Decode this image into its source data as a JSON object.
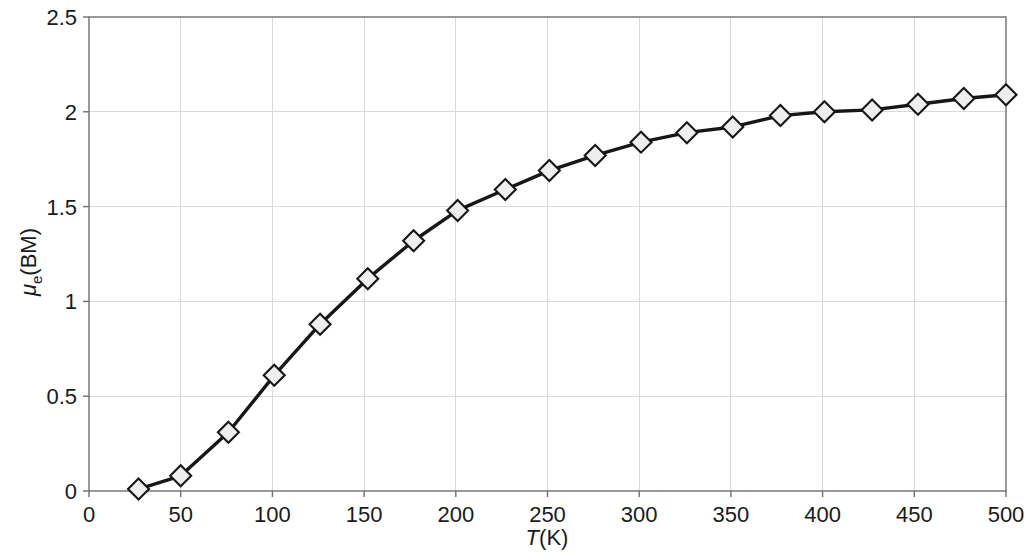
{
  "chart_data": {
    "type": "line",
    "title": "",
    "subtitle": "",
    "xlabel": "T(K)",
    "ylabel": "μe(BM)",
    "xlabel_parts": {
      "italic": "T",
      "rest": "(K)"
    },
    "ylabel_parts": {
      "symbol": "μ",
      "subscript": "e",
      "rest": "(BM)"
    },
    "xlim": [
      0,
      500
    ],
    "ylim": [
      0,
      2.5
    ],
    "xticks": [
      0,
      50,
      100,
      150,
      200,
      250,
      300,
      350,
      400,
      450,
      500
    ],
    "xticklabels": [
      "0",
      "50",
      "100",
      "150",
      "200",
      "250",
      "300",
      "350",
      "400",
      "450",
      "500"
    ],
    "yticks": [
      0,
      0.5,
      1,
      1.5,
      2,
      2.5
    ],
    "yticklabels": [
      "0",
      "0.5",
      "1",
      "1.5",
      "2",
      "2.5"
    ],
    "grid": true,
    "grid_color": "#d8d8d8",
    "legend": null,
    "legend_position": "none",
    "series": [
      {
        "name": "magnetic moment",
        "marker": "diamond",
        "marker_face_color": "#eeeeee",
        "marker_edge_color": "#171717",
        "line_color": "#171717",
        "x": [
          27,
          50,
          76,
          101,
          126,
          152,
          177,
          201,
          227,
          251,
          276,
          301,
          326,
          351,
          377,
          401,
          427,
          452,
          477,
          500
        ],
        "y": [
          0.01,
          0.08,
          0.31,
          0.61,
          0.88,
          1.12,
          1.32,
          1.48,
          1.59,
          1.69,
          1.77,
          1.84,
          1.89,
          1.92,
          1.98,
          2.0,
          2.01,
          2.04,
          2.07,
          2.09
        ]
      }
    ]
  },
  "figure": {
    "background_color": "#ffffff",
    "frame_color": "#6e6e6e",
    "text_color": "#1a1a1a"
  }
}
